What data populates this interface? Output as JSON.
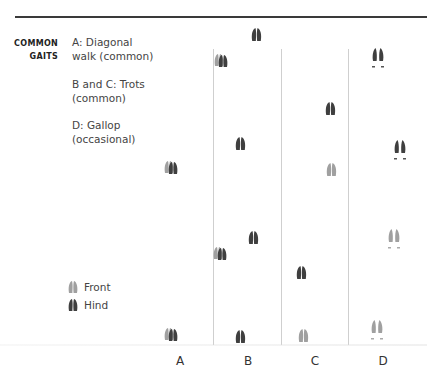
{
  "section": {
    "label_line1": "COMMON",
    "label_line2": "GAITS"
  },
  "gaits": [
    {
      "line1": "A: Diagonal",
      "line2": "walk (common)"
    },
    {
      "line1": "B and C: Trots",
      "line2": "(common)"
    },
    {
      "line1": "D: Gallop",
      "line2": "(occasional)"
    }
  ],
  "legend": {
    "front_label": "Front",
    "hind_label": "Hind"
  },
  "columns": [
    "A",
    "B",
    "C",
    "D"
  ],
  "colors": {
    "front": "#9a9a9a",
    "hind": "#3f3f3f",
    "rule": "#3a3a3a",
    "divider": "#cfcfcf"
  },
  "prints": [
    {
      "column": "A",
      "x": 221,
      "y": 60,
      "type": "overlap"
    },
    {
      "column": "A",
      "x": 172,
      "y": 167,
      "type": "overlap"
    },
    {
      "column": "A",
      "x": 220,
      "y": 253,
      "type": "overlap"
    },
    {
      "column": "A",
      "x": 172,
      "y": 334,
      "type": "overlap"
    },
    {
      "column": "B",
      "x": 256,
      "y": 35,
      "type": "hind"
    },
    {
      "column": "B",
      "x": 240,
      "y": 143,
      "type": "hind"
    },
    {
      "column": "B",
      "x": 253,
      "y": 238,
      "type": "hind"
    },
    {
      "column": "B",
      "x": 240,
      "y": 336,
      "type": "hind"
    },
    {
      "column": "C",
      "x": 330,
      "y": 108,
      "type": "hind"
    },
    {
      "column": "C",
      "x": 331,
      "y": 169,
      "type": "front"
    },
    {
      "column": "C",
      "x": 301,
      "y": 272,
      "type": "hind"
    },
    {
      "column": "C",
      "x": 303,
      "y": 335,
      "type": "front"
    },
    {
      "column": "D",
      "x": 378,
      "y": 57,
      "type": "gallop-hind"
    },
    {
      "column": "D",
      "x": 400,
      "y": 149,
      "type": "gallop-hind"
    },
    {
      "column": "D",
      "x": 394,
      "y": 238,
      "type": "gallop-front"
    },
    {
      "column": "D",
      "x": 377,
      "y": 329,
      "type": "gallop-front"
    }
  ]
}
